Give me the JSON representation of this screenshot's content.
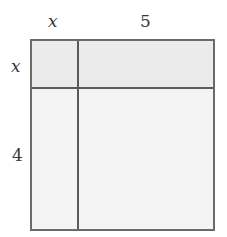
{
  "diagram": {
    "type": "area-model",
    "top_labels": [
      "x",
      "5"
    ],
    "left_labels": [
      "x",
      "4"
    ],
    "regions": [
      {
        "row": 0,
        "col": 0,
        "label": ""
      },
      {
        "row": 0,
        "col": 1,
        "label": ""
      },
      {
        "row": 1,
        "col": 0,
        "label": ""
      },
      {
        "row": 1,
        "col": 1,
        "label": ""
      }
    ],
    "colors": {
      "stroke": "#5a5a5a",
      "top_fill": "#ebebeb",
      "fill": "#f4f4f4"
    }
  }
}
